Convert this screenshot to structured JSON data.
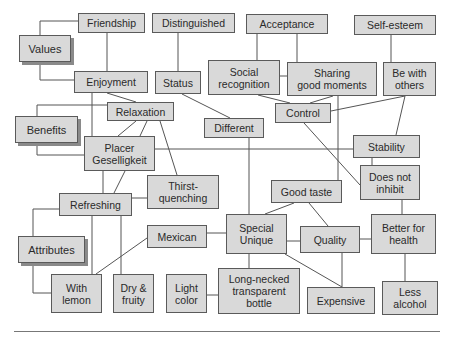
{
  "diagram": {
    "style": {
      "node_fill": "#d9d9d9",
      "node_border": "#5a5a5a",
      "line_color": "#555555",
      "shadow": "#8a8a8a"
    },
    "roots": {
      "values": "Values",
      "benefits": "Benefits",
      "attributes": "Attributes"
    },
    "nodes": {
      "friendship": "Friendship",
      "distinguished": "Distinguished",
      "acceptance": "Acceptance",
      "self_esteem": "Self-esteem",
      "enjoyment": "Enjoyment",
      "status": "Status",
      "social_recognition": "Social\nrecognition",
      "sharing_good_moments": "Sharing\ngood moments",
      "be_with_others": "Be with\nothers",
      "relaxation": "Relaxation",
      "control": "Control",
      "different": "Different",
      "placer_geselligkeit": "Placer\nGeselligkeit",
      "stability": "Stability",
      "does_not_inhibit": "Does not\ninhibit",
      "thirst_quenching": "Thirst-\nquenching",
      "good_taste": "Good taste",
      "refreshing": "Refreshing",
      "mexican": "Mexican",
      "special_unique": "Special\nUnique",
      "quality": "Quality",
      "better_for_health": "Better for\nhealth",
      "with_lemon": "With\nlemon",
      "dry_fruity": "Dry &\nfruity",
      "light_color": "Light\ncolor",
      "long_necked_bottle": "Long-necked\ntransparent\nbottle",
      "expensive": "Expensive",
      "less_alcohol": "Less\nalcohol"
    }
  }
}
